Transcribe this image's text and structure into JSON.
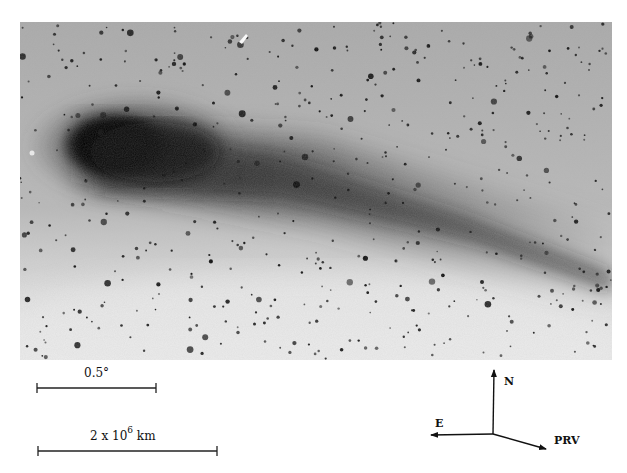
{
  "figure": {
    "photo": {
      "x": 20,
      "y": 22,
      "width": 592,
      "height": 338,
      "background_color": "#b4b4b4",
      "comet_head": {
        "cx": 100,
        "cy": 145
      },
      "tail_direction": "right, slightly downward"
    },
    "scale_bars": [
      {
        "label": "0.5°",
        "x1": 37,
        "x2": 156,
        "y": 388,
        "label_x": 98,
        "label_y": 375
      },
      {
        "label_main": "2 x 10",
        "label_sup": "6",
        "label_unit": " km",
        "x1": 38,
        "x2": 217,
        "y": 451,
        "label_x": 130,
        "label_y": 437
      }
    ],
    "compass": {
      "origin": {
        "x": 493,
        "y": 434
      },
      "arrows": [
        {
          "label": "N",
          "to_x": 494,
          "to_y": 370,
          "label_x": 504,
          "label_y": 384
        },
        {
          "label": "E",
          "to_x": 431,
          "to_y": 435,
          "label_x": 435,
          "label_y": 426
        },
        {
          "label": "PRV",
          "to_x": 546,
          "to_y": 449,
          "label_x": 554,
          "label_y": 443
        }
      ]
    }
  }
}
